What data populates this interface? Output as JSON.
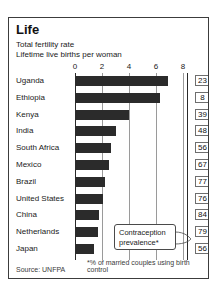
{
  "panel": {
    "title": "Life",
    "subtitle_1": "Total fertility rate",
    "subtitle_2": "Lifetime live births per woman"
  },
  "footer": {
    "source": "Source: UNFPA",
    "note": "*% of married couples using birth control"
  },
  "callout": {
    "line_1": "Contraception",
    "line_2": "prevalence*"
  },
  "chart_data": {
    "type": "bar",
    "orientation": "horizontal",
    "title": "Life",
    "subtitle": "Total fertility rate — Lifetime live births per woman",
    "xlabel": "",
    "ylabel": "",
    "xlim": [
      0,
      8
    ],
    "xticks": [
      0,
      2,
      4,
      6,
      8
    ],
    "xtick_labels": [
      "0",
      "2",
      "4",
      "6",
      "8"
    ],
    "grid": true,
    "legend": false,
    "categories": [
      "Uganda",
      "Ethiopia",
      "Kenya",
      "India",
      "South Africa",
      "Mexico",
      "Brazil",
      "United States",
      "China",
      "Netherlands",
      "Japan"
    ],
    "values": [
      6.9,
      6.3,
      4.0,
      3.0,
      2.7,
      2.5,
      2.2,
      2.1,
      1.8,
      1.7,
      1.4
    ],
    "series": [
      {
        "name": "Total fertility rate",
        "values": [
          6.9,
          6.3,
          4.0,
          3.0,
          2.7,
          2.5,
          2.2,
          2.1,
          1.8,
          1.7,
          1.4
        ]
      },
      {
        "name": "Contraception prevalence*",
        "values": [
          23,
          8,
          39,
          48,
          56,
          67,
          77,
          76,
          84,
          79,
          56
        ]
      }
    ],
    "annotations": [
      "Contraception prevalence*"
    ],
    "source": "Source: UNFPA",
    "footnote": "*% of married couples using birth control",
    "bar_color": "#2b2b2b"
  }
}
